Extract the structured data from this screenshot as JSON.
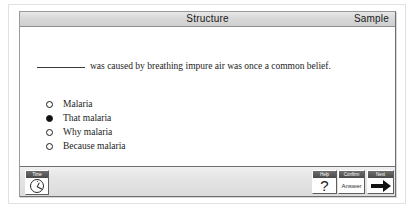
{
  "window": {
    "title_center": "Structure",
    "title_right": "Sample"
  },
  "question": {
    "blank": "________",
    "text": "was caused by breathing impure air was once a common belief."
  },
  "options": [
    {
      "label": "Malaria",
      "selected": false
    },
    {
      "label": "That malaria",
      "selected": true
    },
    {
      "label": "Why malaria",
      "selected": false
    },
    {
      "label": "Because malaria",
      "selected": false
    }
  ],
  "toolbar": {
    "time": {
      "cap": "Time",
      "icon": "clock-icon"
    },
    "help": {
      "cap": "Help",
      "glyph": "?"
    },
    "confirm": {
      "cap": "Confirm",
      "label": "Answer"
    },
    "next": {
      "cap": "Next",
      "icon": "arrow-right-icon"
    }
  },
  "colors": {
    "titlebar": "#d8d8d8",
    "toolbar": "#e4e4e4",
    "text": "#1c1c1c",
    "selected_radio": "#101010"
  }
}
